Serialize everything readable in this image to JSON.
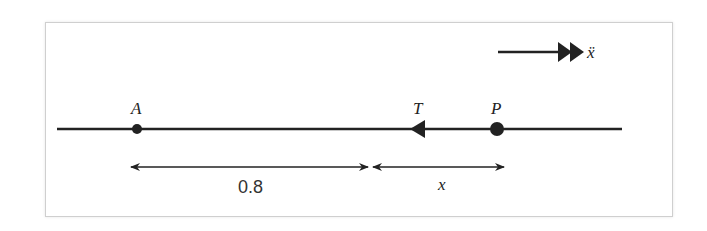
{
  "diagram": {
    "type": "one-dimensional motion diagram",
    "points": [
      {
        "id": "A",
        "label": "A"
      },
      {
        "id": "T",
        "label": "T",
        "description": "tension force arrow pointing left"
      },
      {
        "id": "P",
        "label": "P"
      }
    ],
    "acceleration_label": "ẍ",
    "dimensions": [
      {
        "label": "0.8",
        "from": "A",
        "to": "equilibrium"
      },
      {
        "label": "x",
        "from": "equilibrium",
        "to": "P"
      }
    ],
    "colors": {
      "line": "#222222",
      "frame": "#cfcfcf",
      "background": "#ffffff"
    }
  }
}
